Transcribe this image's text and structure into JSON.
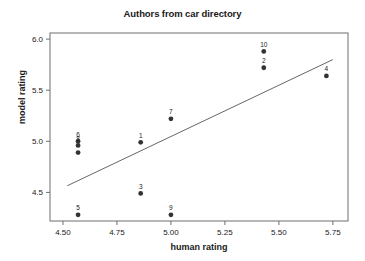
{
  "chart_data": {
    "type": "scatter",
    "title": "Authors from car directory",
    "xlabel": "human rating",
    "ylabel": "model rating",
    "xlim": [
      4.44,
      5.82
    ],
    "ylim": [
      4.22,
      6.06
    ],
    "grid": false,
    "legend": null,
    "xticks": [
      "4.50",
      "4.75",
      "5.00",
      "5.25",
      "5.50",
      "5.75"
    ],
    "xtick_values": [
      4.5,
      4.75,
      5.0,
      5.25,
      5.5,
      5.75
    ],
    "yticks": [
      "4.5",
      "5.0",
      "5.5",
      "6.0"
    ],
    "ytick_values": [
      4.5,
      5.0,
      5.5,
      6.0
    ],
    "points": [
      {
        "label": "6",
        "x": 4.57,
        "y": 5.0
      },
      {
        "label": "8",
        "x": 4.57,
        "y": 4.96
      },
      {
        "label": "",
        "x": 4.57,
        "y": 4.89
      },
      {
        "label": "5",
        "x": 4.57,
        "y": 4.28
      },
      {
        "label": "1",
        "x": 4.86,
        "y": 4.99
      },
      {
        "label": "3",
        "x": 4.86,
        "y": 4.49
      },
      {
        "label": "7",
        "x": 5.0,
        "y": 5.22
      },
      {
        "label": "9",
        "x": 5.0,
        "y": 4.28
      },
      {
        "label": "10",
        "x": 5.43,
        "y": 5.88
      },
      {
        "label": "2",
        "x": 5.43,
        "y": 5.72
      },
      {
        "label": "4",
        "x": 5.72,
        "y": 5.64
      }
    ],
    "fit_line": {
      "name": "linear-fit",
      "x_start": 4.52,
      "y_start": 4.565,
      "x_end": 5.75,
      "y_end": 5.8
    },
    "colors": {
      "marker": "#333333",
      "line": "#555555",
      "axis": "#6e6e6e",
      "text": "#1a1a1a",
      "background": "#ffffff"
    }
  }
}
